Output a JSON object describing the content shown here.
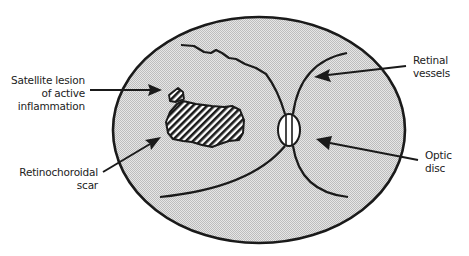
{
  "diagram": {
    "type": "anatomical-fundus-schematic",
    "colors": {
      "fundus_fill": "#d9d9d9",
      "outline": "#1a1a1a",
      "disc_fill": "#ffffff",
      "background": "#ffffff"
    }
  },
  "labels": {
    "satellite": {
      "line1": "Satellite lesion",
      "line2": "of active",
      "line3": "inflammation"
    },
    "scar": {
      "line1": "Retinochoroidal",
      "line2": "scar"
    },
    "vessels": {
      "line1": "Retinal",
      "line2": "vessels"
    },
    "disc": {
      "line1": "Optic",
      "line2": "disc"
    }
  }
}
